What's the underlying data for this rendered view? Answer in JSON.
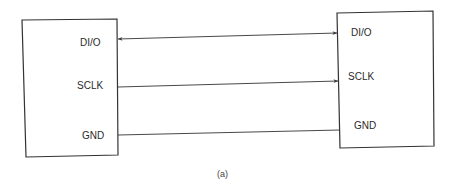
{
  "diagram": {
    "left_device": {
      "pins": [
        {
          "label": "DI/O"
        },
        {
          "label": "SCLK"
        },
        {
          "label": "GND"
        }
      ]
    },
    "right_device": {
      "pins": [
        {
          "label": "DI/O"
        },
        {
          "label": "SCLK"
        },
        {
          "label": "GND"
        }
      ]
    },
    "connections": [
      {
        "from": "DI/O",
        "to": "DI/O",
        "direction": "bidirectional"
      },
      {
        "from": "SCLK",
        "to": "SCLK",
        "direction": "left-to-right"
      },
      {
        "from": "GND",
        "to": "GND",
        "direction": "none"
      }
    ],
    "caption": "(a)",
    "line_color": "#333333"
  }
}
